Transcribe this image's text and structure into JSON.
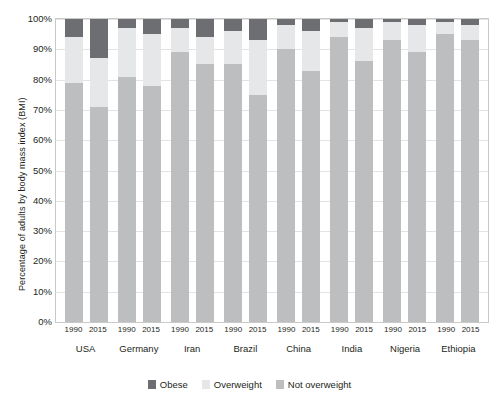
{
  "chart_data": {
    "type": "bar",
    "subtype": "stacked-percentage",
    "title": "",
    "xlabel": "",
    "ylabel": "Percentage of adults by body mass index (BMI)",
    "ylim": [
      0,
      100
    ],
    "yticks": [
      "0%",
      "10%",
      "20%",
      "30%",
      "40%",
      "50%",
      "60%",
      "70%",
      "80%",
      "90%",
      "100%"
    ],
    "grid": true,
    "legend_position": "bottom-center",
    "categories": [
      "USA 1990",
      "USA 2015",
      "Germany 1990",
      "Germany 2015",
      "Iran 1990",
      "Iran 2015",
      "Brazil 1990",
      "Brazil 2015",
      "China 1990",
      "China 2015",
      "India 1990",
      "India 2015",
      "Nigeria 1990",
      "Nigeria 2015",
      "Ethiopia 1990",
      "Ethiopia 2015"
    ],
    "countries": [
      "USA",
      "Germany",
      "Iran",
      "Brazil",
      "China",
      "India",
      "Nigeria",
      "Ethiopia"
    ],
    "years": [
      "1990",
      "2015"
    ],
    "series": [
      {
        "name": "Not overweight",
        "color": "#bcbec0",
        "values": [
          79,
          71,
          81,
          78,
          89,
          85,
          85,
          75,
          90,
          83,
          94,
          86,
          93,
          89,
          95,
          93
        ]
      },
      {
        "name": "Overweight",
        "color": "#e6e7e8",
        "values": [
          15,
          16,
          16,
          17,
          8,
          9,
          11,
          18,
          8,
          13,
          5,
          11,
          6,
          9,
          4,
          5
        ]
      },
      {
        "name": "Obese",
        "color": "#6d6e71",
        "values": [
          6,
          13,
          3,
          5,
          3,
          6,
          4,
          7,
          2,
          4,
          1,
          3,
          1,
          2,
          1,
          2
        ]
      }
    ],
    "legend": [
      {
        "label": "Obese",
        "color": "#6d6e71"
      },
      {
        "label": "Overweight",
        "color": "#e6e7e8"
      },
      {
        "label": "Not overweight",
        "color": "#bcbec0"
      }
    ]
  }
}
